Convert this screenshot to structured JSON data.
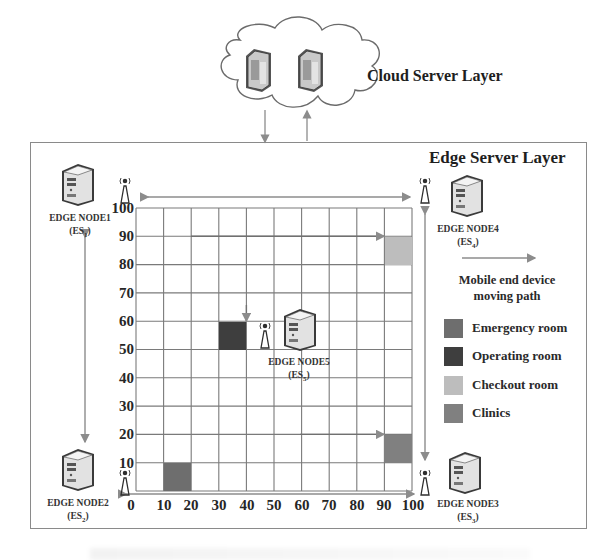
{
  "cloud_layer": {
    "title": "Cloud Server Layer",
    "servers": [
      {
        "icon": "server-icon"
      },
      {
        "icon": "server-icon"
      }
    ]
  },
  "edge_layer": {
    "title": "Edge Server Layer",
    "nodes": [
      {
        "name": "EDGE NODE1",
        "id_prefix": "(ES",
        "id_sub": "1",
        "id_suffix": ")"
      },
      {
        "name": "EDGE NODE2",
        "id_prefix": "(ES",
        "id_sub": "2",
        "id_suffix": ")"
      },
      {
        "name": "EDGE NODE3",
        "id_prefix": "(ES",
        "id_sub": "3",
        "id_suffix": ")"
      },
      {
        "name": "EDGE NODE4",
        "id_prefix": "(ES",
        "id_sub": "4",
        "id_suffix": ")"
      },
      {
        "name": "EDGE NODE5",
        "id_prefix": "(ES",
        "id_sub": "5",
        "id_suffix": ")"
      }
    ]
  },
  "grid": {
    "x_ticks": [
      "0",
      "10",
      "20",
      "30",
      "40",
      "50",
      "60",
      "70",
      "80",
      "90",
      "100"
    ],
    "y_ticks": [
      "100",
      "90",
      "80",
      "70",
      "60",
      "50",
      "40",
      "30",
      "20",
      "10"
    ],
    "rooms": [
      {
        "type": "Checkout room",
        "x": 90,
        "y": 80
      },
      {
        "type": "Operating room",
        "x": 30,
        "y": 50
      },
      {
        "type": "Clinics",
        "x": 90,
        "y": 10
      },
      {
        "type": "Emergency room",
        "x": 10,
        "y": 0
      }
    ]
  },
  "legend": {
    "path_label_line1": "Mobile end device",
    "path_label_line2": "moving path",
    "items": [
      {
        "label": "Emergency room",
        "color": "#6e6e6e"
      },
      {
        "label": "Operating room",
        "color": "#3e3e3e"
      },
      {
        "label": "Checkout room",
        "color": "#bdbdbd"
      },
      {
        "label": "Clinics",
        "color": "#808080"
      }
    ]
  },
  "colors": {
    "grid_line": "#7a7a7a",
    "frame": "#8a8a8a",
    "arrow": "#8c8c8c"
  }
}
